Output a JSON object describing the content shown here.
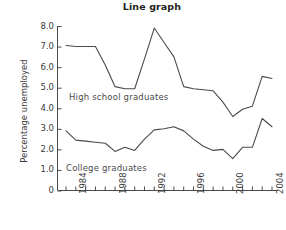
{
  "chart_data": {
    "type": "line",
    "title": "Line graph",
    "xlabel": "",
    "ylabel": "Percentage unemployed",
    "xlim": [
      1983,
      2004
    ],
    "ylim": [
      0,
      8
    ],
    "grid": false,
    "legend_position": "inline-labels",
    "y_ticks": [
      "0",
      "1.0",
      "2.0",
      "3.0",
      "4.0",
      "5.0",
      "6.0",
      "7.0",
      "8.0"
    ],
    "y_tick_values": [
      0,
      1,
      2,
      3,
      4,
      5,
      6,
      7,
      8
    ],
    "x_ticks_major": [
      "1984",
      "1988",
      "1992",
      "1996",
      "2000",
      "2004"
    ],
    "x_tick_values_major": [
      1984,
      1988,
      1992,
      1996,
      2000,
      2004
    ],
    "x_all_years": [
      1983,
      1984,
      1985,
      1986,
      1987,
      1988,
      1989,
      1990,
      1991,
      1992,
      1993,
      1994,
      1995,
      1996,
      1997,
      1998,
      1999,
      2000,
      2001,
      2002,
      2003,
      2004
    ],
    "series": [
      {
        "name": "High school graduates",
        "color": "#4a4a4a",
        "values": [
          7.05,
          7.0,
          7.0,
          7.0,
          6.1,
          5.05,
          4.95,
          4.95,
          6.4,
          7.9,
          7.2,
          6.5,
          5.05,
          4.95,
          4.9,
          4.85,
          4.3,
          3.6,
          3.95,
          4.1,
          5.55,
          5.45
        ]
      },
      {
        "name": "College graduates",
        "color": "#4a4a4a",
        "values": [
          2.9,
          2.45,
          2.4,
          2.35,
          2.3,
          1.9,
          2.1,
          1.95,
          2.5,
          2.95,
          3.0,
          3.1,
          2.9,
          2.5,
          2.15,
          1.95,
          2.0,
          1.55,
          2.1,
          2.1,
          3.5,
          3.1
        ]
      }
    ],
    "annotations": [
      {
        "text": "High school graduates",
        "x": 1985.6,
        "y": 4.6
      },
      {
        "text": "College graduates",
        "x": 1985.4,
        "y": 1.35
      }
    ]
  },
  "labels": {
    "title": "Line graph",
    "ylabel": "Percentage unemployed",
    "highschool": "High school graduates",
    "college": "College graduates"
  }
}
